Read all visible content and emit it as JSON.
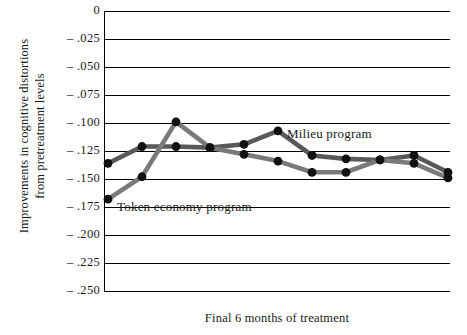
{
  "chart_data": {
    "type": "line",
    "title": "",
    "xlabel": "Final 6 months of treatment",
    "ylabel": "Improvements in cognitive distortions\nfrom pretreatment levels",
    "ylim": [
      -0.25,
      0
    ],
    "ytick_labels": [
      "0",
      "– .025",
      "– .050",
      "– .075",
      "– .100",
      "– .125",
      "– .150",
      "– .175",
      "– .200",
      "– .225",
      "– .250"
    ],
    "ytick_values": [
      0,
      -0.025,
      -0.05,
      -0.075,
      -0.1,
      -0.125,
      -0.15,
      -0.175,
      -0.2,
      -0.225,
      -0.25
    ],
    "xtick_labels": [],
    "grid": true,
    "legend_position": "inline-annotations",
    "x": [
      1,
      2,
      3,
      4,
      5,
      6,
      7,
      8,
      9,
      10,
      11
    ],
    "series": [
      {
        "name": "Milieu program",
        "color": "#595959",
        "marker": "circle",
        "values": [
          -0.136,
          -0.121,
          -0.121,
          -0.122,
          -0.119,
          -0.107,
          -0.129,
          -0.132,
          -0.133,
          -0.129,
          -0.144
        ]
      },
      {
        "name": "Token economy program",
        "color": "#7a7a7a",
        "marker": "circle",
        "values": [
          -0.168,
          -0.148,
          -0.099,
          -0.122,
          -0.128,
          -0.134,
          -0.144,
          -0.144,
          -0.133,
          -0.136,
          -0.149
        ]
      }
    ],
    "annotations": [
      {
        "text": "Milieu program",
        "x": 7.0,
        "y": -0.107
      },
      {
        "text": "Token economy program",
        "x": 2.4,
        "y": -0.185
      }
    ]
  },
  "colors": {
    "axis": "#000000",
    "grid": "#000000",
    "marker": "#111111",
    "milieu_line": "#595959",
    "token_line": "#7a7a7a",
    "background": "#ffffff"
  }
}
